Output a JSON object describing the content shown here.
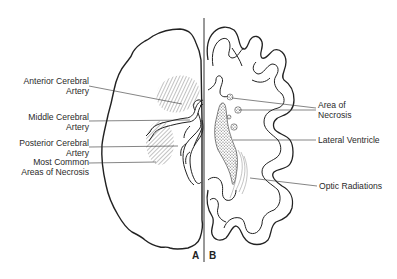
{
  "figure": {
    "panels": {
      "left": "A",
      "right": "B"
    },
    "left_labels": [
      {
        "id": "anterior-cerebral-artery",
        "line1": "Anterior Cerebral",
        "line2": "Artery"
      },
      {
        "id": "middle-cerebral-artery",
        "line1": "Middle Cerebral",
        "line2": "Artery"
      },
      {
        "id": "posterior-cerebral-artery",
        "line1": "Posterior Cerebral",
        "line2": "Artery"
      },
      {
        "id": "most-common-areas-of-necrosis",
        "line1": "Most Common",
        "line2": "Areas of Necrosis"
      }
    ],
    "right_labels": [
      {
        "id": "area-of-necrosis",
        "line1": "Area of",
        "line2": "Necrosis"
      },
      {
        "id": "lateral-ventricle",
        "line1": "Lateral Ventricle"
      },
      {
        "id": "optic-radiations",
        "line1": "Optic Radiations"
      }
    ],
    "colors": {
      "ink": "#222222",
      "background": "#ffffff",
      "hatch": "#555555"
    }
  }
}
